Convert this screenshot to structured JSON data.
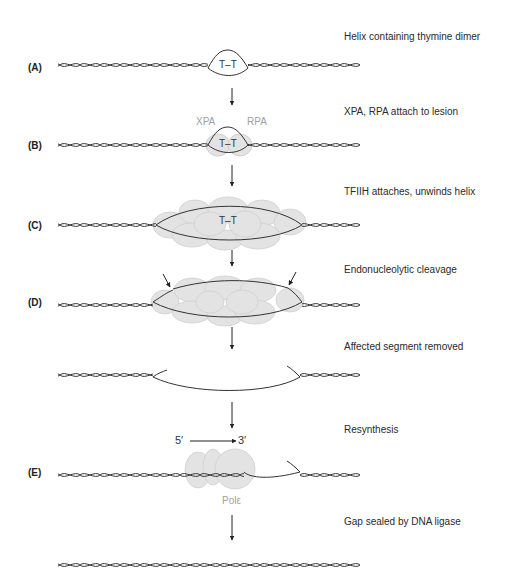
{
  "steps": [
    {
      "letter": "(A)",
      "label": "Helix containing thymine dimer"
    },
    {
      "letter": "(B)",
      "label": "XPA, RPA attach to lesion"
    },
    {
      "letter": "(C)",
      "label": "TFIIH attaches, unwinds helix"
    },
    {
      "letter": "(D)",
      "label": "Endonucleolytic cleavage"
    },
    {
      "letter": "",
      "label": "Affected segment removed"
    },
    {
      "letter": "(E)",
      "label": "Resynthesis"
    },
    {
      "letter": "",
      "label": "Gap sealed by DNA ligase"
    }
  ],
  "dimer_label": "T–T",
  "proteins": {
    "xpa": "XPA",
    "rpa": "RPA",
    "pol": "Polε"
  },
  "direction": {
    "five": "5′",
    "three": "3′"
  },
  "colors": {
    "protein_fill": "#e3e3e3",
    "protein_stroke": "#cfcfcf",
    "strand": "#333333",
    "protein_text": "#a0a0a0"
  }
}
